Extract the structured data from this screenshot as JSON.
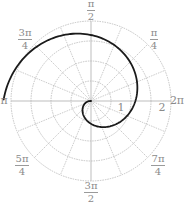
{
  "chart_data": {
    "type": "line",
    "subtype": "polar",
    "title": "",
    "center_px": [
      91,
      101
    ],
    "ring_radius_px": 20,
    "rings": [
      1,
      2,
      3,
      4
    ],
    "spokes": 16,
    "radial_tick_labels": [
      {
        "text": "1",
        "x": 121,
        "y": 108
      },
      {
        "text": "2",
        "x": 162,
        "y": 108
      }
    ],
    "angle_labels": [
      {
        "num": "π",
        "den": "2",
        "x": 91,
        "y": 9
      },
      {
        "num": "π",
        "den": "4",
        "x": 154,
        "y": 38
      },
      {
        "num": "3π",
        "den": "4",
        "x": 25,
        "y": 38
      },
      {
        "num": "",
        "den": "",
        "single": "π",
        "x": 4,
        "y": 101
      },
      {
        "num": "",
        "den": "",
        "single": "2π",
        "x": 177,
        "y": 101
      },
      {
        "num": "5π",
        "den": "4",
        "x": 22,
        "y": 164
      },
      {
        "num": "7π",
        "den": "4",
        "x": 158,
        "y": 164
      },
      {
        "num": "3π",
        "den": "2",
        "x": 91,
        "y": 191
      }
    ],
    "series": [
      {
        "name": "spiral",
        "color": "#1a1a1a",
        "angle_deg_start": 175,
        "angle_deg_end": 540,
        "r_px_per_deg": 0.24,
        "points_deg_r": [
          [
            200,
            6
          ],
          [
            240,
            15
          ],
          [
            270,
            23
          ],
          [
            315,
            34
          ],
          [
            360,
            44
          ],
          [
            405,
            55
          ],
          [
            450,
            66
          ],
          [
            495,
            77
          ],
          [
            540,
            88
          ]
        ]
      }
    ],
    "grid": true,
    "grid_color": "#b5b5b5"
  }
}
